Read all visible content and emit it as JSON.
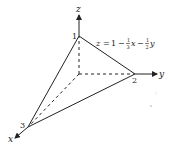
{
  "diagram": {
    "equation": {
      "lhs": "z",
      "eq": "=",
      "const": "1",
      "minus1": "−",
      "frac1_num": "1",
      "frac1_den": "3",
      "var1": "x",
      "minus2": "−",
      "frac2_num": "1",
      "frac2_den": "2",
      "var2": "y"
    },
    "axes": {
      "x": "x",
      "y": "y",
      "z": "z"
    },
    "intercepts": {
      "z": "1",
      "y": "2",
      "x": "3"
    },
    "colors": {
      "ink": "#222222",
      "background": "#ffffff"
    }
  }
}
